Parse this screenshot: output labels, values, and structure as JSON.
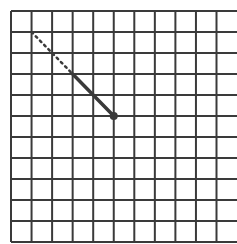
{
  "diagram": {
    "type": "grid-with-path",
    "grid": {
      "columns": 11,
      "rows": 11,
      "right_edge_closed": false
    },
    "colors": {
      "grid_line": "#3a3a3a",
      "path": "#3a3a3a",
      "background": "#ffffff"
    },
    "path": {
      "dotted_segment": {
        "from": [
          1,
          1
        ],
        "to": [
          3,
          3
        ]
      },
      "solid_segment": {
        "from": [
          3,
          3
        ],
        "to": [
          5,
          5
        ]
      },
      "endpoint": [
        5,
        5
      ]
    }
  }
}
